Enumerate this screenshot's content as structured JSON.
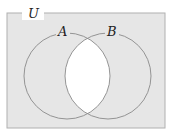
{
  "diagram": {
    "type": "venn",
    "universe_label": "U",
    "sets": [
      {
        "label": "A",
        "cx": 67,
        "cy": 76,
        "r": 43
      },
      {
        "label": "B",
        "cx": 108,
        "cy": 76,
        "r": 43
      }
    ],
    "shaded_region": "complement of A ∩ B",
    "colors": {
      "shade": "#e6e6e6",
      "unshaded": "#ffffff",
      "stroke": "#8a8a8a",
      "border": "#b0b0b0"
    }
  }
}
